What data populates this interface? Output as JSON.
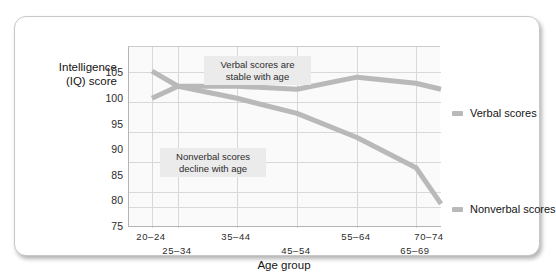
{
  "chart_data": {
    "type": "line",
    "title": "",
    "xlabel": "Age group",
    "ylabel": "Intelligence (IQ) score",
    "ylim": [
      75,
      105
    ],
    "yticks": [
      75,
      80,
      85,
      90,
      95,
      100,
      105
    ],
    "grid": true,
    "legend_position": "right",
    "categories": [
      "20-24",
      "25-34",
      "35-44",
      "45-54",
      "55-64",
      "65-69",
      "70-74"
    ],
    "series": [
      {
        "name": "Verbal scores",
        "values": [
          96.5,
          98.5,
          98.5,
          98.0,
          100.0,
          99.0,
          98.0
        ],
        "color": "#b9b9b9"
      },
      {
        "name": "Nonverbal scores",
        "values": [
          101.0,
          98.5,
          96.5,
          94.0,
          90.0,
          85.0,
          79.0
        ],
        "color": "#b9b9b9"
      }
    ],
    "annotations": [
      {
        "text_line1": "Verbal scores are",
        "text_line2": "stable with age"
      },
      {
        "text_line1": "Nonverbal scores",
        "text_line2": "decline with age"
      }
    ]
  },
  "axis": {
    "y_title_line1": "Intelligence",
    "y_title_line2": "(IQ) score",
    "x_title": "Age group",
    "y_labels": [
      "105",
      "100",
      "95",
      "90",
      "85",
      "80",
      "75"
    ],
    "x_labels_upper": [
      "20–24",
      "35–44",
      "55–64",
      "70–74"
    ],
    "x_labels_lower": [
      "25–34",
      "45–54",
      "65–69"
    ]
  },
  "legend": {
    "items": [
      {
        "label": "Verbal scores"
      },
      {
        "label": "Nonverbal scores"
      }
    ]
  },
  "annotations": {
    "verbal_l1": "Verbal scores are",
    "verbal_l2": "stable with age",
    "nonverbal_l1": "Nonverbal scores",
    "nonverbal_l2": "decline with age"
  },
  "colors": {
    "line": "#b9b9b9",
    "grid": "#d8d8d8",
    "plot_bg": "#fafafa",
    "annotation_bg": "#ebebeb"
  }
}
